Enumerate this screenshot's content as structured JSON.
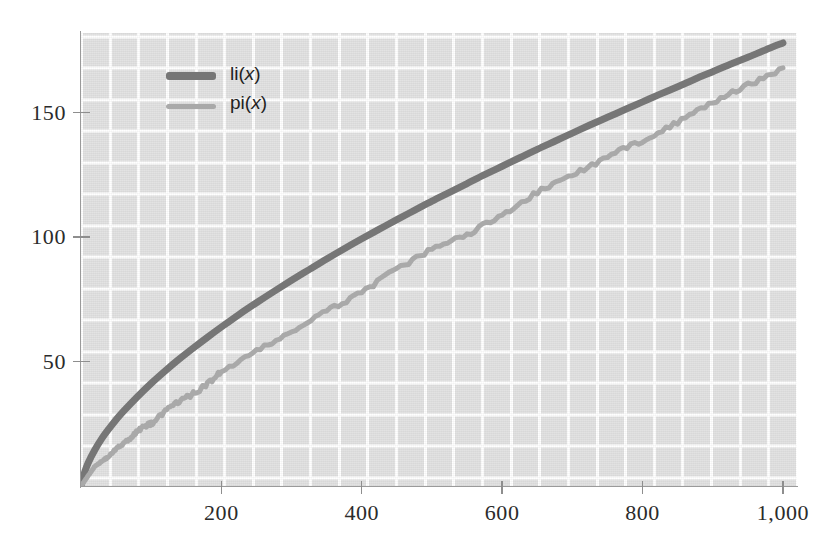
{
  "chart_data": {
    "type": "line",
    "title": "",
    "subtitle": "",
    "xlabel": "",
    "ylabel": "",
    "xlim": [
      0,
      1020
    ],
    "ylim": [
      0,
      182
    ],
    "grid": true,
    "grid_color": "#ffffff",
    "plot_background": "#e2e2e2",
    "legend_position": "upper-left-inside",
    "x_ticks": [
      200,
      400,
      600,
      800,
      1000
    ],
    "x_tick_labels": [
      "200",
      "400",
      "600",
      "800",
      "1,000"
    ],
    "y_ticks": [
      50,
      100,
      150
    ],
    "y_tick_labels": [
      "50",
      "100",
      "150"
    ],
    "series": [
      {
        "name": "li(x)",
        "label_base": "li",
        "label_arg": "x",
        "color": "#767676",
        "width": 7,
        "x": [
          0,
          5,
          10,
          20,
          30,
          40,
          50,
          60,
          80,
          100,
          120,
          140,
          160,
          180,
          200,
          225,
          250,
          275,
          300,
          325,
          350,
          375,
          400,
          425,
          450,
          475,
          500,
          525,
          550,
          575,
          600,
          625,
          650,
          675,
          700,
          725,
          750,
          775,
          800,
          825,
          850,
          875,
          900,
          925,
          950,
          975,
          1000
        ],
        "y": [
          0,
          3.6,
          6.2,
          9.9,
          13.0,
          15.6,
          18.0,
          20.2,
          24.2,
          27.9,
          31.3,
          34.5,
          37.5,
          40.4,
          43.2,
          46.6,
          49.8,
          52.9,
          55.9,
          58.8,
          61.7,
          64.5,
          67.2,
          69.8,
          72.4,
          74.9,
          77.4,
          79.8,
          82.2,
          84.6,
          86.9,
          89.2,
          91.5,
          93.7,
          95.9,
          98.1,
          100.2,
          102.3,
          104.4,
          106.5,
          108.5,
          110.6,
          112.6,
          114.6,
          116.5,
          118.5,
          120.4
        ],
        "note": "logarithmic integral li(x)"
      },
      {
        "name": "pi(x)",
        "label_base": "pi",
        "label_arg": "x",
        "color": "#a9a9a9",
        "width": 5,
        "x": [
          0,
          10,
          20,
          30,
          40,
          50,
          60,
          70,
          80,
          90,
          100,
          120,
          140,
          160,
          180,
          200,
          250,
          300,
          350,
          400,
          450,
          500,
          550,
          600,
          650,
          700,
          750,
          800,
          850,
          900,
          950,
          1000
        ],
        "y": [
          0,
          4,
          8,
          10,
          12,
          15,
          17,
          19,
          22,
          24,
          25,
          30,
          34,
          37,
          41,
          46,
          54,
          62,
          70,
          78,
          87,
          95,
          101,
          109,
          118,
          125,
          132,
          139,
          146,
          154,
          161,
          168
        ],
        "note": "prime counting function pi(x); plotted as a staircase"
      }
    ],
    "endpoints": {
      "li_at_1000": 178,
      "pi_at_1000": 168
    }
  },
  "axes": {
    "y": {
      "ticks": [
        {
          "value": 50,
          "label": "50"
        },
        {
          "value": 100,
          "label": "100"
        },
        {
          "value": 150,
          "label": "150"
        }
      ]
    },
    "x": {
      "ticks": [
        {
          "value": 200,
          "label": "200"
        },
        {
          "value": 400,
          "label": "400"
        },
        {
          "value": 600,
          "label": "600"
        },
        {
          "value": 800,
          "label": "800"
        },
        {
          "value": 1000,
          "label": "1,000"
        }
      ]
    }
  },
  "legend": {
    "items": [
      {
        "base": "li",
        "open": "(",
        "arg": "x",
        "close": ")",
        "style": "thick",
        "color": "#767676"
      },
      {
        "base": "pi",
        "open": "(",
        "arg": "x",
        "close": ")",
        "style": "thin",
        "color": "#a9a9a9"
      }
    ]
  }
}
